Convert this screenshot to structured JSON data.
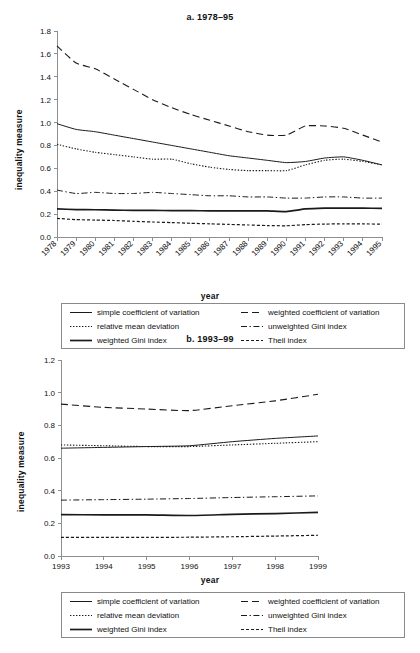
{
  "figure": {
    "background": "#ffffff",
    "line_color": "#1a1a1a",
    "axis_color": "#8e8e8e"
  },
  "legend": {
    "entries": [
      {
        "label": "simple coefficient of variation",
        "style": "solid-thin",
        "key": "simple_cv"
      },
      {
        "label": "weighted coefficient of variation",
        "style": "dashed-long",
        "key": "weighted_cv"
      },
      {
        "label": "relative mean deviation",
        "style": "dotted",
        "key": "relative_mean_deviation"
      },
      {
        "label": "unweighted Gini index",
        "style": "dash-dot",
        "key": "unweighted_gini"
      },
      {
        "label": "weighted Gini index",
        "style": "solid-thick",
        "key": "weighted_gini"
      },
      {
        "label": "Theil index",
        "style": "dashed-short",
        "key": "theil"
      }
    ]
  },
  "chart_data": [
    {
      "id": "panel-a",
      "type": "line",
      "title": "a. 1978–95",
      "xlabel": "year",
      "ylabel": "inequality measure",
      "grid": false,
      "legend_position": "below",
      "x_rotated": true,
      "categories": [
        1978,
        1979,
        1980,
        1981,
        1982,
        1983,
        1984,
        1985,
        1986,
        1987,
        1988,
        1989,
        1990,
        1991,
        1992,
        1993,
        1994,
        1995
      ],
      "xtick_labels": [
        "1978",
        "1979",
        "1980",
        "1981",
        "1982",
        "1983",
        "1984",
        "1985",
        "1986",
        "1987",
        "1988",
        "1989",
        "1990",
        "1991",
        "1992",
        "1993",
        "1994",
        "1995"
      ],
      "ylim": [
        0.0,
        1.8
      ],
      "ytick_labels": [
        "0.0",
        "0.2",
        "0.4",
        "0.6",
        "0.8",
        "1.0",
        "1.2",
        "1.4",
        "1.6",
        "1.8"
      ],
      "yticks": [
        0.0,
        0.2,
        0.4,
        0.6,
        0.8,
        1.0,
        1.2,
        1.4,
        1.6,
        1.8
      ],
      "series": [
        {
          "name": "weighted coefficient of variation",
          "style": "dashed-long",
          "values": [
            1.67,
            1.52,
            1.47,
            1.38,
            1.29,
            1.2,
            1.13,
            1.07,
            1.02,
            0.97,
            0.92,
            0.89,
            0.89,
            0.97,
            0.97,
            0.95,
            0.89,
            0.83
          ]
        },
        {
          "name": "simple coefficient of variation",
          "style": "solid-thin",
          "values": [
            0.99,
            0.94,
            0.92,
            0.89,
            0.86,
            0.83,
            0.8,
            0.77,
            0.74,
            0.71,
            0.69,
            0.67,
            0.65,
            0.66,
            0.69,
            0.7,
            0.67,
            0.63
          ]
        },
        {
          "name": "relative mean deviation",
          "style": "dotted",
          "values": [
            0.81,
            0.77,
            0.74,
            0.72,
            0.7,
            0.68,
            0.68,
            0.64,
            0.61,
            0.59,
            0.58,
            0.58,
            0.58,
            0.63,
            0.67,
            0.68,
            0.66,
            0.63
          ]
        },
        {
          "name": "unweighted Gini index",
          "style": "dash-dot",
          "values": [
            0.41,
            0.38,
            0.39,
            0.38,
            0.38,
            0.39,
            0.38,
            0.37,
            0.36,
            0.36,
            0.35,
            0.35,
            0.34,
            0.34,
            0.35,
            0.35,
            0.34,
            0.34
          ]
        },
        {
          "name": "weighted Gini index",
          "style": "solid-thick",
          "values": [
            0.245,
            0.24,
            0.238,
            0.235,
            0.233,
            0.232,
            0.231,
            0.23,
            0.229,
            0.228,
            0.228,
            0.228,
            0.222,
            0.245,
            0.252,
            0.253,
            0.252,
            0.25
          ]
        },
        {
          "name": "Theil index",
          "style": "dashed-short",
          "values": [
            0.163,
            0.152,
            0.148,
            0.144,
            0.137,
            0.131,
            0.126,
            0.12,
            0.115,
            0.11,
            0.105,
            0.1,
            0.098,
            0.108,
            0.113,
            0.115,
            0.114,
            0.113
          ]
        }
      ]
    },
    {
      "id": "panel-b",
      "type": "line",
      "title": "b. 1993–99",
      "xlabel": "year",
      "ylabel": "inequality measure",
      "grid": false,
      "legend_position": "below",
      "x_rotated": false,
      "categories": [
        1993,
        1994,
        1995,
        1996,
        1997,
        1998,
        1999
      ],
      "xtick_labels": [
        "1993",
        "1994",
        "1995",
        "1996",
        "1997",
        "1998",
        "1999"
      ],
      "ylim": [
        0.0,
        1.2
      ],
      "ytick_labels": [
        "0.0",
        "0.2",
        "0.4",
        "0.6",
        "0.8",
        "1.0",
        "1.2"
      ],
      "yticks": [
        0.0,
        0.2,
        0.4,
        0.6,
        0.8,
        1.0,
        1.2
      ],
      "series": [
        {
          "name": "weighted coefficient of variation",
          "style": "dashed-long",
          "values": [
            0.93,
            0.91,
            0.9,
            0.89,
            0.92,
            0.95,
            0.99
          ]
        },
        {
          "name": "relative mean deviation",
          "style": "dotted",
          "values": [
            0.68,
            0.675,
            0.67,
            0.67,
            0.68,
            0.69,
            0.7
          ]
        },
        {
          "name": "simple coefficient of variation",
          "style": "solid-thin",
          "values": [
            0.66,
            0.665,
            0.67,
            0.675,
            0.7,
            0.72,
            0.735
          ]
        },
        {
          "name": "unweighted Gini index",
          "style": "dash-dot",
          "values": [
            0.342,
            0.345,
            0.348,
            0.352,
            0.358,
            0.363,
            0.368
          ]
        },
        {
          "name": "weighted Gini index",
          "style": "solid-thick",
          "values": [
            0.253,
            0.252,
            0.252,
            0.248,
            0.255,
            0.26,
            0.267
          ]
        },
        {
          "name": "Theil index",
          "style": "dashed-short",
          "values": [
            0.114,
            0.114,
            0.114,
            0.115,
            0.118,
            0.122,
            0.127
          ]
        }
      ]
    }
  ]
}
